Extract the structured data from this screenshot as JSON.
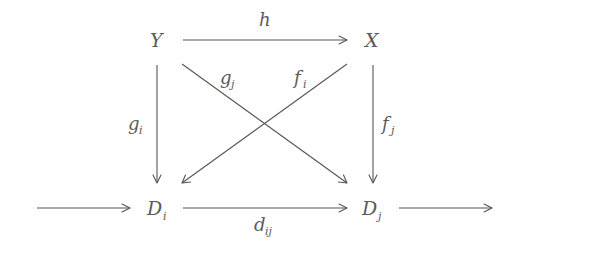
{
  "diagram": {
    "type": "commutative-diagram",
    "nodes": {
      "Y": {
        "main": "Y",
        "sub": ""
      },
      "X": {
        "main": "X",
        "sub": ""
      },
      "Di": {
        "main": "D",
        "sub": "i"
      },
      "Dj": {
        "main": "D",
        "sub": "j"
      }
    },
    "edges": {
      "h": {
        "from": "Y",
        "to": "X",
        "label": "h",
        "sub": ""
      },
      "gi": {
        "from": "Y",
        "to": "Di",
        "label": "g",
        "sub": "i"
      },
      "gj": {
        "from": "Y",
        "to": "Dj",
        "label": "g",
        "sub": "j"
      },
      "fi": {
        "from": "X",
        "to": "Di",
        "label": "f",
        "sub": "i"
      },
      "fj": {
        "from": "X",
        "to": "Dj",
        "label": "f",
        "sub": "j"
      },
      "dij": {
        "from": "Di",
        "to": "Dj",
        "label": "d",
        "sub": "ij"
      },
      "incoming": {
        "from": "",
        "to": "Di",
        "label": "",
        "sub": ""
      },
      "outgoing": {
        "from": "Dj",
        "to": "",
        "label": "",
        "sub": ""
      }
    },
    "colors": {
      "stroke": "#555555",
      "text": "#5a5a5a",
      "background": "#ffffff"
    }
  }
}
